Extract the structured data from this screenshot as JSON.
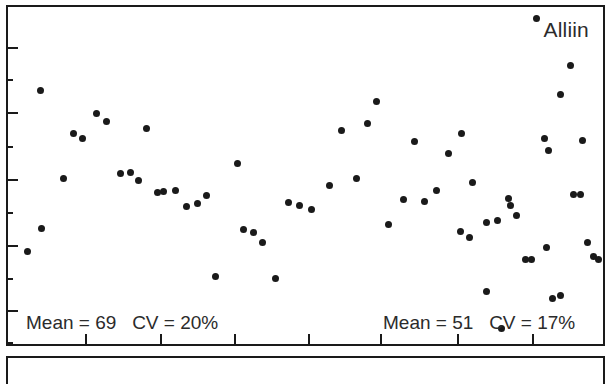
{
  "chart_data": {
    "type": "scatter",
    "title": "Alliin",
    "xlabel": "",
    "ylabel": "",
    "xlim": [
      0,
      100
    ],
    "ylim": [
      0,
      100
    ],
    "grid": false,
    "legend": null,
    "marker": {
      "shape": "circle",
      "color": "#1a1a1a",
      "size_px": 7
    },
    "axis_color": "#1a1a1a",
    "background": "#ffffff",
    "y_major_ticks": [
      88.0,
      68.8,
      49.0,
      29.5,
      10.0
    ],
    "y_minor_ticks": [
      78.5,
      58.9,
      39.2,
      19.6,
      0.5
    ],
    "x_major_ticks": [
      13.0,
      25.5,
      38.0,
      50.5,
      62.5,
      75.5,
      88.0
    ],
    "groups": [
      {
        "name": "group-left",
        "mean": 69,
        "cv_percent": 20,
        "annotation": "Mean = 69   CV = 20%",
        "n": 45
      },
      {
        "name": "group-right",
        "mean": 51,
        "cv_percent": 17,
        "annotation": "Mean = 51   CV = 17%",
        "n": 20
      }
    ],
    "series": [
      {
        "name": "Alliin measurements",
        "points": [
          [
            3.2,
            27.5
          ],
          [
            5.6,
            34.3
          ],
          [
            5.4,
            75.2
          ],
          [
            9.3,
            49.0
          ],
          [
            11.0,
            62.5
          ],
          [
            12.5,
            61.0
          ],
          [
            14.8,
            68.5
          ],
          [
            16.6,
            66.0
          ],
          [
            18.9,
            50.6
          ],
          [
            20.6,
            51.0
          ],
          [
            21.9,
            48.6
          ],
          [
            23.2,
            63.8
          ],
          [
            25.2,
            45.0
          ],
          [
            26.2,
            45.2
          ],
          [
            28.2,
            45.5
          ],
          [
            30.0,
            40.8
          ],
          [
            31.8,
            41.6
          ],
          [
            33.4,
            44.0
          ],
          [
            34.8,
            20.0
          ],
          [
            38.5,
            53.5
          ],
          [
            39.5,
            34.0
          ],
          [
            41.2,
            33.2
          ],
          [
            42.7,
            30.0
          ],
          [
            45.0,
            19.5
          ],
          [
            47.2,
            42.0
          ],
          [
            49.0,
            41.2
          ],
          [
            51.0,
            40.0
          ],
          [
            54.0,
            47.0
          ],
          [
            56.0,
            63.5
          ],
          [
            58.5,
            49.0
          ],
          [
            60.5,
            65.5
          ],
          [
            61.9,
            72.0
          ],
          [
            64.0,
            35.5
          ],
          [
            66.5,
            43.0
          ],
          [
            68.3,
            60.0
          ],
          [
            70.0,
            42.3
          ],
          [
            72.0,
            45.5
          ],
          [
            74.0,
            56.5
          ],
          [
            76.2,
            62.5
          ],
          [
            78.0,
            48.0
          ],
          [
            80.5,
            36.0
          ],
          [
            82.2,
            36.5
          ],
          [
            84.2,
            43.2
          ],
          [
            85.5,
            38.0
          ],
          [
            88.8,
            96.5
          ],
          [
            90.2,
            61.0
          ],
          [
            90.8,
            57.5
          ],
          [
            92.8,
            74.0
          ],
          [
            94.5,
            82.5
          ],
          [
            96.5,
            60.5
          ]
        ]
      },
      {
        "name": "Alliin measurements second batch",
        "points": [
          [
            76.0,
            33.5
          ],
          [
            77.5,
            31.5
          ],
          [
            80.5,
            15.5
          ],
          [
            83.0,
            4.5
          ],
          [
            84.5,
            41.0
          ],
          [
            87.0,
            25.0
          ],
          [
            88.0,
            25.2
          ],
          [
            90.5,
            28.5
          ],
          [
            91.5,
            13.5
          ],
          [
            92.8,
            14.5
          ],
          [
            95.0,
            44.5
          ],
          [
            96.2,
            44.3
          ],
          [
            97.4,
            30.0
          ],
          [
            98.4,
            26.0
          ],
          [
            99.2,
            25.0
          ]
        ]
      }
    ]
  },
  "panels": {
    "secondary_panel_label": ""
  }
}
